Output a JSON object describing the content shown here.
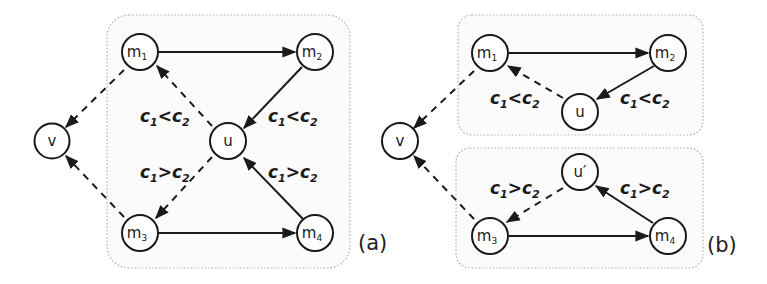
{
  "diagram": {
    "panels": [
      {
        "id": "a",
        "label": "(a)",
        "nodes": [
          {
            "id": "v",
            "text": "v",
            "sub": ""
          },
          {
            "id": "m1",
            "text": "m",
            "sub": "1"
          },
          {
            "id": "m2",
            "text": "m",
            "sub": "2"
          },
          {
            "id": "u",
            "text": "u",
            "sub": ""
          },
          {
            "id": "m3",
            "text": "m",
            "sub": "3"
          },
          {
            "id": "m4",
            "text": "m",
            "sub": "4"
          }
        ],
        "conditions": [
          {
            "c": "c",
            "s1": "1",
            "op": "<",
            "c2": "c",
            "s2": "2"
          },
          {
            "c": "c",
            "s1": "1",
            "op": "<",
            "c2": "c",
            "s2": "2"
          },
          {
            "c": "c",
            "s1": "1",
            "op": ">",
            "c2": "c",
            "s2": "2"
          },
          {
            "c": "c",
            "s1": "1",
            "op": ">",
            "c2": "c",
            "s2": "2"
          }
        ],
        "edges": [
          {
            "from": "m1",
            "to": "m2",
            "style": "solid"
          },
          {
            "from": "m2",
            "to": "u",
            "style": "solid"
          },
          {
            "from": "u",
            "to": "m1",
            "style": "dashed"
          },
          {
            "from": "m1",
            "to": "v",
            "style": "dashed"
          },
          {
            "from": "m3",
            "to": "m4",
            "style": "solid"
          },
          {
            "from": "m4",
            "to": "u",
            "style": "solid"
          },
          {
            "from": "u",
            "to": "m3",
            "style": "dashed"
          },
          {
            "from": "m3",
            "to": "v",
            "style": "dashed"
          }
        ]
      },
      {
        "id": "b",
        "label": "(b)",
        "nodes": [
          {
            "id": "v",
            "text": "v",
            "sub": ""
          },
          {
            "id": "m1",
            "text": "m",
            "sub": "1"
          },
          {
            "id": "m2",
            "text": "m",
            "sub": "2"
          },
          {
            "id": "u",
            "text": "u",
            "sub": ""
          },
          {
            "id": "u_prime",
            "text": "u′",
            "sub": ""
          },
          {
            "id": "m3",
            "text": "m",
            "sub": "3"
          },
          {
            "id": "m4",
            "text": "m",
            "sub": "4"
          }
        ],
        "conditions": [
          {
            "c": "c",
            "s1": "1",
            "op": "<",
            "c2": "c",
            "s2": "2"
          },
          {
            "c": "c",
            "s1": "1",
            "op": "<",
            "c2": "c",
            "s2": "2"
          },
          {
            "c": "c",
            "s1": "1",
            "op": ">",
            "c2": "c",
            "s2": "2"
          },
          {
            "c": "c",
            "s1": "1",
            "op": ">",
            "c2": "c",
            "s2": "2"
          }
        ],
        "edges": [
          {
            "from": "m1",
            "to": "m2",
            "style": "solid"
          },
          {
            "from": "m2",
            "to": "u",
            "style": "solid"
          },
          {
            "from": "u",
            "to": "m1",
            "style": "dashed"
          },
          {
            "from": "m1",
            "to": "v",
            "style": "dashed"
          },
          {
            "from": "m3",
            "to": "m4",
            "style": "solid"
          },
          {
            "from": "m4",
            "to": "u_prime",
            "style": "solid"
          },
          {
            "from": "u_prime",
            "to": "m3",
            "style": "dashed"
          },
          {
            "from": "m3",
            "to": "v",
            "style": "dashed"
          }
        ]
      }
    ],
    "colors": {
      "stroke": "#1a1a1a",
      "box_border": "#b0b0b0",
      "box_fill": "#fbfbfb"
    }
  }
}
